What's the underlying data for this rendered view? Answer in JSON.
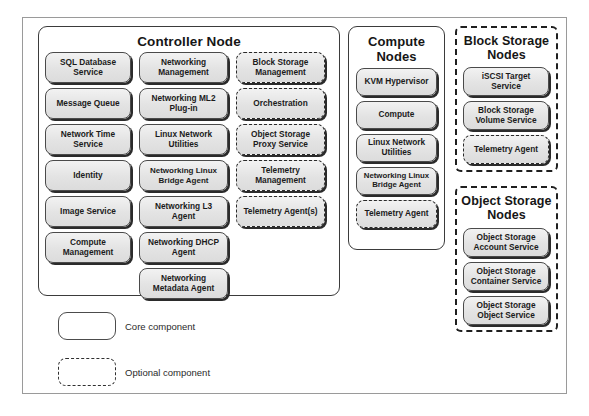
{
  "diagram": {
    "groups": [
      {
        "id": "controller",
        "title": "Controller Node",
        "style": "solid",
        "columns": [
          [
            {
              "label": "SQL Database Service",
              "type": "core"
            },
            {
              "label": "Message Queue",
              "type": "core"
            },
            {
              "label": "Network Time Service",
              "type": "core"
            },
            {
              "label": "Identity",
              "type": "core"
            },
            {
              "label": "Image Service",
              "type": "core"
            },
            {
              "label": "Compute Management",
              "type": "core"
            }
          ],
          [
            {
              "label": "Networking Management",
              "type": "core"
            },
            {
              "label": "Networking ML2 Plug-in",
              "type": "core"
            },
            {
              "label": "Linux Network Utilities",
              "type": "core"
            },
            {
              "label": "Networking Linux Bridge Agent",
              "type": "core"
            },
            {
              "label": "Networking L3 Agent",
              "type": "core"
            },
            {
              "label": "Networking DHCP Agent",
              "type": "core"
            },
            {
              "label": "Networking Metadata Agent",
              "type": "core"
            }
          ],
          [
            {
              "label": "Block Storage Management",
              "type": "optional"
            },
            {
              "label": "Orchestration",
              "type": "optional"
            },
            {
              "label": "Object Storage Proxy Service",
              "type": "optional"
            },
            {
              "label": "Telemetry Management",
              "type": "optional"
            },
            {
              "label": "Telemetry Agent(s)",
              "type": "optional"
            }
          ]
        ]
      },
      {
        "id": "compute",
        "title": "Compute Nodes",
        "style": "solid",
        "columns": [
          [
            {
              "label": "KVM Hypervisor",
              "type": "core"
            },
            {
              "label": "Compute",
              "type": "core"
            },
            {
              "label": "Linux Network Utilities",
              "type": "core"
            },
            {
              "label": "Networking Linux Bridge Agent",
              "type": "core"
            },
            {
              "label": "Telemetry Agent",
              "type": "optional"
            }
          ]
        ]
      },
      {
        "id": "block-storage",
        "title": "Block Storage Nodes",
        "style": "dashed",
        "columns": [
          [
            {
              "label": "iSCSI Target Service",
              "type": "core"
            },
            {
              "label": "Block Storage Volume Service",
              "type": "core"
            },
            {
              "label": "Telemetry Agent",
              "type": "optional"
            }
          ]
        ]
      },
      {
        "id": "object-storage",
        "title": "Object Storage Nodes",
        "style": "dashed",
        "columns": [
          [
            {
              "label": "Object Storage Account Service",
              "type": "core"
            },
            {
              "label": "Object Storage Container Service",
              "type": "core"
            },
            {
              "label": "Object Storage Object Service",
              "type": "core"
            }
          ]
        ]
      }
    ],
    "legend": [
      {
        "type": "core",
        "label": "Core component"
      },
      {
        "type": "optional",
        "label": "Optional component"
      }
    ]
  }
}
